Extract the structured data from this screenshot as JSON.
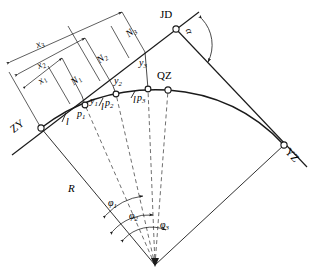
{
  "diagram": {
    "stroke_color": "#1a1a1a",
    "dash_color": "#555555",
    "background": "#ffffff"
  },
  "control_points": {
    "zy": {
      "label": "ZY",
      "x": 41,
      "y": 128
    },
    "jd": {
      "label": "JD",
      "x": 176,
      "y": 29
    },
    "yz": {
      "label": "YZ",
      "x": 284,
      "y": 145
    },
    "qz": {
      "label": "QZ",
      "x": 168,
      "y": 90
    },
    "center": {
      "label": "O",
      "x": 155,
      "y": 265
    }
  },
  "curve_points": [
    {
      "label": "p",
      "index": "1",
      "x": 85,
      "y": 105
    },
    {
      "label": "p",
      "index": "2",
      "x": 116,
      "y": 94
    },
    {
      "label": "p",
      "index": "3",
      "x": 148,
      "y": 89
    }
  ],
  "offsets_y": [
    {
      "label": "y",
      "index": "1"
    },
    {
      "label": "y",
      "index": "2"
    },
    {
      "label": "y",
      "index": "3"
    }
  ],
  "normals_N": [
    {
      "label": "N",
      "index": "1"
    },
    {
      "label": "N",
      "index": "2"
    },
    {
      "label": "N",
      "index": "3"
    }
  ],
  "abscissas_x": [
    {
      "label": "x",
      "index": "1"
    },
    {
      "label": "x",
      "index": "2"
    },
    {
      "label": "x",
      "index": "3"
    }
  ],
  "angles_phi": [
    {
      "label": "φ",
      "index": "1"
    },
    {
      "label": "φ",
      "index": "2"
    },
    {
      "label": "φ",
      "index": "3"
    }
  ],
  "chords": [
    {
      "label": "l"
    },
    {
      "label": "l"
    },
    {
      "label": "l"
    }
  ],
  "radius": {
    "label": "R"
  },
  "deflection_angle": {
    "label": "α"
  }
}
